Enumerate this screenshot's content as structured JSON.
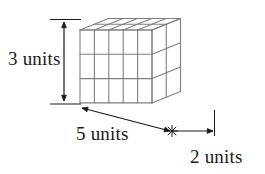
{
  "figure": {
    "type": "oblique-projection-solid",
    "background_color": "#ffffff",
    "line_color": "#808080",
    "line_width": 1.1,
    "text_color": "#1a1a1a"
  },
  "solid": {
    "shape": "rectangular-prism",
    "width_units": 5,
    "height_units": 3,
    "depth_units": 2,
    "total_unit_cubes": 30,
    "volume_units_cubed": 30,
    "origin_front_top_left": {
      "x": 80,
      "y": 30
    },
    "cell_width_px": 14.4,
    "cell_height_px": 24.3,
    "depth_step_px": {
      "x": 14.25,
      "y": -5.75
    }
  },
  "dimensions": [
    {
      "name": "height",
      "label": "3 units",
      "value": 3,
      "unit": "units",
      "orientation": "vertical",
      "label_position": {
        "x": 8,
        "y": 65
      },
      "arrow": {
        "x1": 64,
        "y1": 22,
        "x2": 64,
        "y2": 101
      },
      "ticks": [
        {
          "x1": 50,
          "y1": 19.5,
          "x2": 81,
          "y2": 19.5
        },
        {
          "x1": 50,
          "y1": 104,
          "x2": 81,
          "y2": 104
        }
      ]
    },
    {
      "name": "width",
      "label": "5 units",
      "value": 5,
      "unit": "units",
      "orientation": "oblique",
      "label_position": {
        "x": 76,
        "y": 140
      },
      "arrow": {
        "x1": 82,
        "y1": 108,
        "x2": 170,
        "y2": 131
      },
      "ticks": []
    },
    {
      "name": "depth",
      "label": "2 units",
      "value": 2,
      "unit": "units",
      "orientation": "horizontal",
      "label_position": {
        "x": 190,
        "y": 163
      },
      "arrow": {
        "x1": 173,
        "y1": 131,
        "x2": 213,
        "y2": 131
      },
      "ticks": [
        {
          "x1": 214.5,
          "y1": 110,
          "x2": 214.5,
          "y2": 136
        }
      ],
      "junction_marker": {
        "x": 172,
        "y": 131,
        "radius": 6
      }
    }
  ]
}
